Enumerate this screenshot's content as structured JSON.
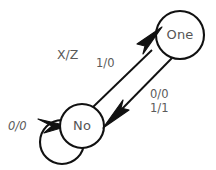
{
  "diagram": {
    "type": "state-machine",
    "title": "",
    "background_color": "#ffffff",
    "stroke_color": "#111111",
    "text_color": "#5a5a5a",
    "legend": {
      "label": "X/Z",
      "meaning_input": "X",
      "meaning_output": "Z"
    },
    "states": [
      {
        "id": "no",
        "label": "No",
        "cx": 82,
        "cy": 126,
        "r": 22
      },
      {
        "id": "one",
        "label": "One",
        "cx": 180,
        "cy": 35,
        "r": 24
      }
    ],
    "transitions": [
      {
        "id": "no-self",
        "from": "no",
        "to": "no",
        "kind": "self-loop",
        "label": "0/0",
        "label_lines": [
          "0/0"
        ],
        "label_x": 8,
        "label_y": 119,
        "italic": true
      },
      {
        "id": "no-to-one",
        "from": "no",
        "to": "one",
        "kind": "arc",
        "label": "1/0",
        "label_lines": [
          "1/0"
        ],
        "label_x": 96,
        "label_y": 56,
        "italic": false
      },
      {
        "id": "one-to-no",
        "from": "one",
        "to": "no",
        "kind": "arc",
        "label": "0/0 1/1",
        "label_lines": [
          "0/0",
          "1/1"
        ],
        "label_x": 150,
        "label_y": 88,
        "italic": false
      }
    ]
  }
}
